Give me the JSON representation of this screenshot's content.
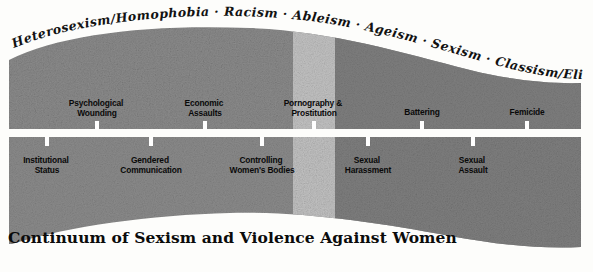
{
  "figure": {
    "title": "Continuum of Sexism and Violence Against Women",
    "oppressions_arc": {
      "separator": "·",
      "items": [
        "Heterosexism/Homophobia",
        "Racism",
        "Ableism",
        "Ageism",
        "Sexism",
        "Classism/Elitism"
      ],
      "full_text": "Heterosexism/Homophobia  ·  Racism  ·  Ableism  ·  Ageism  ·  Sexism  ·  Classism/Elitism"
    },
    "upper_band": {
      "labels": [
        {
          "line1": "Psychological",
          "line2": "Wounding",
          "x": 97
        },
        {
          "line1": "Economic",
          "line2": "Assaults",
          "x": 205
        },
        {
          "line1": "Pornography &",
          "line2": "Prostitution",
          "x": 314
        },
        {
          "line1": "Battering",
          "line2": "",
          "x": 422
        },
        {
          "line1": "Femicide",
          "line2": "",
          "x": 527
        }
      ]
    },
    "lower_band": {
      "labels": [
        {
          "line1": "Institutional",
          "line2": "Status",
          "x": 47
        },
        {
          "line1": "Gendered",
          "line2": "Communication",
          "x": 151
        },
        {
          "line1": "Controlling",
          "line2": "Women's Bodies",
          "x": 262
        },
        {
          "line1": "Sexual",
          "line2": "Harassment",
          "x": 368
        },
        {
          "line1": "Sexual",
          "line2": "Assault",
          "x": 473
        }
      ]
    },
    "colors": {
      "band_gray": "#8b8b8b",
      "band_gray_dark": "#7b7b7b",
      "band_light_column": "#bcbcbc",
      "ink": "#0a0a0a",
      "paper": "#fdfdfb"
    }
  }
}
